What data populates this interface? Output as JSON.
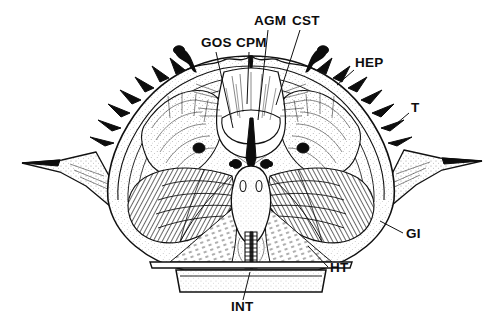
{
  "figure": {
    "style": "black-and-white line drawing, stippled and hatched",
    "orientation": "bilaterally symmetric transverse (cross) section",
    "background_color": "#ffffff",
    "ink_color": "#111111"
  },
  "labels": [
    {
      "id": "GOS",
      "text": "GOS",
      "x": 201,
      "y": 47,
      "anchor": "start",
      "leader": {
        "x1": 216,
        "y1": 52,
        "x2": 233,
        "y2": 128
      }
    },
    {
      "id": "CPM",
      "text": "CPM",
      "x": 236,
      "y": 47,
      "anchor": "start",
      "leader": {
        "x1": 249,
        "y1": 52,
        "x2": 247,
        "y2": 104
      }
    },
    {
      "id": "AGM",
      "text": "AGM",
      "x": 254,
      "y": 25,
      "anchor": "start",
      "leader": {
        "x1": 268,
        "y1": 30,
        "x2": 258,
        "y2": 120
      }
    },
    {
      "id": "CST",
      "text": "CST",
      "x": 292,
      "y": 25,
      "anchor": "start",
      "leader": {
        "x1": 300,
        "y1": 30,
        "x2": 276,
        "y2": 105
      }
    },
    {
      "id": "HEP",
      "text": "HEP",
      "x": 355,
      "y": 67,
      "anchor": "start",
      "leader": {
        "x1": 354,
        "y1": 70,
        "x2": 339,
        "y2": 84
      }
    },
    {
      "id": "T",
      "text": "T",
      "x": 411,
      "y": 112,
      "anchor": "start",
      "leader": {
        "x1": 409,
        "y1": 113,
        "x2": 396,
        "y2": 124
      }
    },
    {
      "id": "GI",
      "text": "GI",
      "x": 406,
      "y": 238,
      "anchor": "start",
      "leader": {
        "x1": 403,
        "y1": 233,
        "x2": 382,
        "y2": 222
      }
    },
    {
      "id": "HT",
      "text": "HT",
      "x": 330,
      "y": 272,
      "anchor": "start",
      "leader": {
        "x1": 328,
        "y1": 267,
        "x2": 308,
        "y2": 246
      }
    },
    {
      "id": "INT",
      "text": "INT",
      "x": 231,
      "y": 311,
      "anchor": "start",
      "leader": {
        "x1": 243,
        "y1": 300,
        "x2": 250,
        "y2": 272
      }
    }
  ],
  "structures": [
    {
      "name": "carapace-outline",
      "description": "broad arched carapace with spiny dorsal margin and lateral spine extensions"
    },
    {
      "name": "lateral-spine-left",
      "description": "long tapering left lateral carapace spine"
    },
    {
      "name": "lateral-spine-right",
      "description": "long tapering right lateral carapace spine"
    },
    {
      "name": "hepatopancreas-left",
      "description": "lobed digestive gland mass, left side"
    },
    {
      "name": "hepatopancreas-right",
      "description": "lobed digestive gland mass, right side"
    },
    {
      "name": "gill-lamellae-left",
      "description": "radiating hatched gill filaments, left branchial chamber"
    },
    {
      "name": "gill-lamellae-right",
      "description": "radiating hatched gill filaments, right branchial chamber"
    },
    {
      "name": "gastric-cavity",
      "description": "central dorsal stomach cavity with suspensory muscle strands"
    },
    {
      "name": "intestine",
      "description": "segmented midline intestine descending to sternum"
    },
    {
      "name": "heart-region",
      "description": "central body cavity below gastric mill"
    },
    {
      "name": "sternum-plate",
      "description": "horizontal ventral sternal plate at base"
    },
    {
      "name": "eye-spot-left",
      "description": "small solid black nodule, left"
    },
    {
      "name": "eye-spot-right",
      "description": "small solid black nodule, right"
    },
    {
      "name": "dorsal-spine-left",
      "description": "solid black hooked dorsal spine, left of midline"
    },
    {
      "name": "dorsal-spine-right",
      "description": "solid black hooked dorsal spine, right of midline"
    }
  ]
}
